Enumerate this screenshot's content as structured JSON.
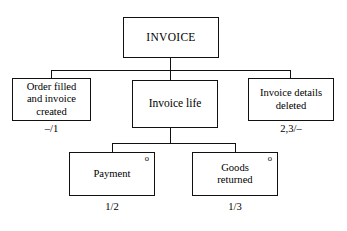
{
  "diagram": {
    "type": "structure-decomposition-diagram",
    "background_color": "#ffffff",
    "line_color": "#111111",
    "nodes": {
      "root": {
        "label": "INVOICE",
        "caption": "",
        "optional_marker": ""
      },
      "order_filled": {
        "label": "Order filled\nand invoice\ncreated",
        "caption": "–/1",
        "optional_marker": ""
      },
      "invoice_life": {
        "label": "Invoice life",
        "caption": "",
        "optional_marker": ""
      },
      "invoice_deleted": {
        "label": "Invoice details\ndeleted",
        "caption": "2,3/–",
        "optional_marker": ""
      },
      "payment": {
        "label": "Payment",
        "caption": "1/2",
        "optional_marker": "o"
      },
      "goods_returned": {
        "label": "Goods\nreturned",
        "caption": "1/3",
        "optional_marker": "o"
      }
    }
  }
}
